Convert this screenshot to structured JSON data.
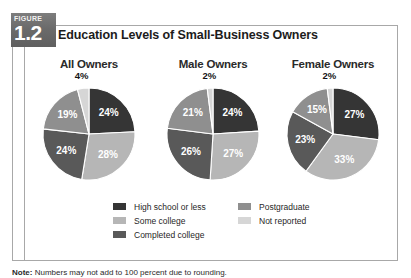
{
  "figure": {
    "badge_word": "FIGURE",
    "badge_number": "1.2",
    "title": "Education Levels of Small-Business Owners",
    "note_prefix": "Note:",
    "note_text": " Numbers may not add to 100 percent due to rounding."
  },
  "colors": {
    "high_school_or_less": "#353535",
    "some_college": "#b6b6b6",
    "completed_college": "#595959",
    "postgraduate": "#8f8f8f",
    "not_reported": "#d6d6d6",
    "badge_gray": "#6e6e6e",
    "border_gray": "#a8a8a8",
    "title_text": "#1c1c1c"
  },
  "legend": {
    "columns": [
      {
        "items": [
          {
            "label": "High school or less",
            "color_key": "high_school_or_less",
            "swatch": "#353535"
          },
          {
            "label": "Some college",
            "color_key": "some_college",
            "swatch": "#b6b6b6"
          },
          {
            "label": "Completed college",
            "color_key": "completed_college",
            "swatch": "#595959"
          }
        ]
      },
      {
        "items": [
          {
            "label": "Postgraduate",
            "color_key": "postgraduate",
            "swatch": "#8f8f8f"
          },
          {
            "label": "Not reported",
            "color_key": "not_reported",
            "swatch": "#d6d6d6"
          }
        ]
      }
    ]
  },
  "chart_data": [
    {
      "type": "pie",
      "title": "All Owners",
      "categories": [
        "High school or less",
        "Some college",
        "Completed college",
        "Postgraduate",
        "Not reported"
      ],
      "values": [
        24,
        28,
        24,
        19,
        4
      ],
      "labels": [
        "24%",
        "28%",
        "24%",
        "19%",
        "4%"
      ],
      "label_positions": [
        "inside",
        "inside",
        "inside",
        "inside",
        "outside"
      ],
      "colors": [
        "#353535",
        "#b6b6b6",
        "#595959",
        "#8f8f8f",
        "#d6d6d6"
      ],
      "start_angle": 0,
      "direction": "clockwise",
      "legend_position": "bottom-center",
      "grid": false
    },
    {
      "type": "pie",
      "title": "Male Owners",
      "categories": [
        "High school or less",
        "Some college",
        "Completed college",
        "Postgraduate",
        "Not reported"
      ],
      "values": [
        24,
        27,
        26,
        21,
        2
      ],
      "labels": [
        "24%",
        "27%",
        "26%",
        "21%",
        "2%"
      ],
      "label_positions": [
        "inside",
        "inside",
        "inside",
        "inside",
        "outside"
      ],
      "colors": [
        "#353535",
        "#b6b6b6",
        "#595959",
        "#8f8f8f",
        "#d6d6d6"
      ],
      "start_angle": 0,
      "direction": "clockwise",
      "legend_position": "bottom-center",
      "grid": false
    },
    {
      "type": "pie",
      "title": "Female Owners",
      "categories": [
        "High school or less",
        "Some college",
        "Completed college",
        "Postgraduate",
        "Not reported"
      ],
      "values": [
        27,
        33,
        23,
        15,
        2
      ],
      "labels": [
        "27%",
        "33%",
        "23%",
        "15%",
        "2%"
      ],
      "label_positions": [
        "inside",
        "inside",
        "inside",
        "inside",
        "outside"
      ],
      "colors": [
        "#353535",
        "#b6b6b6",
        "#595959",
        "#8f8f8f",
        "#d6d6d6"
      ],
      "start_angle": 0,
      "direction": "clockwise",
      "legend_position": "bottom-center",
      "grid": false
    }
  ]
}
